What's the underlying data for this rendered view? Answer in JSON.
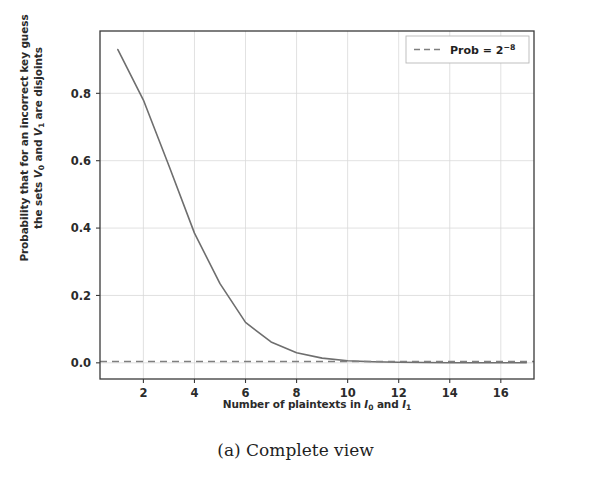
{
  "figure": {
    "caption": "(a) Complete view",
    "background_color": "#ffffff"
  },
  "chart_data": {
    "type": "line",
    "title": "",
    "xlabel": "Number of plaintexts in I0 and I1",
    "xlabel_parts": {
      "prefix": "Number of plaintexts in ",
      "var1": "I",
      "sub1": "0",
      "middle": " and ",
      "var2": "I",
      "sub2": "1"
    },
    "ylabel": "Probability that for an incorrect key guess the sets V0 and V1 are disjoints",
    "ylabel_line1": "Probability that for an incorrect key guess",
    "ylabel_line2_parts": {
      "prefix": "the sets ",
      "var1": "V",
      "sub1": "0",
      "middle": " and ",
      "var2": "V",
      "sub2": "1",
      "suffix": " are disjoints"
    },
    "x": [
      1,
      2,
      3,
      4,
      5,
      6,
      7,
      8,
      9,
      10,
      11,
      12,
      13,
      14,
      15,
      16,
      17
    ],
    "series": [
      {
        "name": "disjoint-probability",
        "color": "#6e6e6e",
        "linestyle": "solid",
        "linewidth": 1.6,
        "values": [
          0.93,
          0.78,
          0.585,
          0.385,
          0.235,
          0.12,
          0.062,
          0.03,
          0.014,
          0.006,
          0.003,
          0.0015,
          0.0008,
          0.0004,
          0.0002,
          0.0001,
          5e-05
        ]
      },
      {
        "name": "prob-threshold",
        "color": "#7f7f7f",
        "linestyle": "dashed",
        "linewidth": 1.6,
        "constant_value": 0.0039,
        "legend_label": "Prob = 2^-8",
        "legend_label_parts": {
          "text": "Prob = 2",
          "sup": "−8"
        }
      }
    ],
    "xlim": [
      0.3,
      17.3
    ],
    "ylim": [
      -0.048,
      0.985
    ],
    "xticks": [
      2,
      4,
      6,
      8,
      10,
      12,
      14,
      16
    ],
    "xticklabels": [
      "2",
      "4",
      "6",
      "8",
      "10",
      "12",
      "14",
      "16"
    ],
    "yticks": [
      0.0,
      0.2,
      0.4,
      0.6,
      0.8
    ],
    "yticklabels": [
      "0.0",
      "0.2",
      "0.4",
      "0.6",
      "0.8"
    ],
    "grid": true,
    "grid_color": "#d9d9d9",
    "legend_position": "upper right",
    "axes_border_color": "#3a3a3a"
  }
}
